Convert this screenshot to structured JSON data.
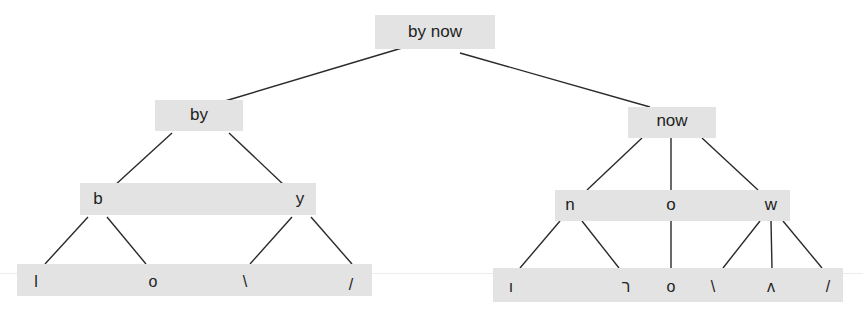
{
  "diagram": {
    "type": "syntax-tree",
    "root": {
      "label": "by now"
    },
    "level1": [
      {
        "id": "by",
        "label": "by"
      },
      {
        "id": "now",
        "label": "now"
      }
    ],
    "level2": {
      "left": [
        {
          "id": "b",
          "label": "b"
        },
        {
          "id": "y",
          "label": "y"
        }
      ],
      "right": [
        {
          "id": "n",
          "label": "n"
        },
        {
          "id": "o",
          "label": "o"
        },
        {
          "id": "w",
          "label": "w"
        }
      ]
    },
    "level3": {
      "left": [
        {
          "parent": "b",
          "label": "l"
        },
        {
          "parent": "b",
          "label": "o"
        },
        {
          "parent": "y",
          "label": "\\"
        },
        {
          "parent": "y",
          "label": "/"
        }
      ],
      "right": [
        {
          "parent": "n",
          "label": "ı"
        },
        {
          "parent": "n",
          "label": "ר"
        },
        {
          "parent": "o",
          "label": "o"
        },
        {
          "parent": "w",
          "label": "\\"
        },
        {
          "parent": "w",
          "label": "ʌ"
        },
        {
          "parent": "w",
          "label": "/"
        }
      ]
    },
    "colors": {
      "box_fill": "#e3e3e3",
      "edge": "#2a2a2a",
      "text": "#1e1e1e"
    }
  }
}
